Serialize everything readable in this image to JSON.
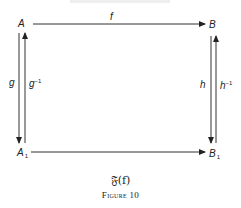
{
  "diagram": {
    "nodes": {
      "A": "A",
      "B": "B",
      "A1": "A",
      "A1_sub": "1",
      "B1": "B",
      "B1_sub": "1"
    },
    "arrows": {
      "f": "f",
      "g": "g",
      "g_inv": "g",
      "g_inv_sup": "−1",
      "h": "h",
      "h_inv": "h",
      "h_inv_sup": "−1"
    },
    "caption": {
      "functor": "𝔉(f)",
      "figure": "Figure 10"
    }
  }
}
